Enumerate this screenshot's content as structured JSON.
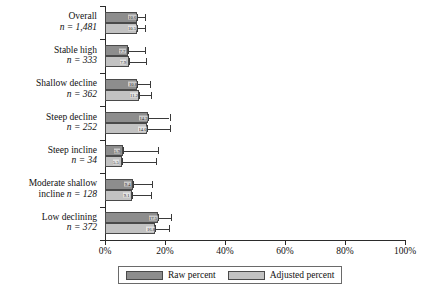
{
  "chart_data": {
    "type": "bar",
    "orientation": "horizontal",
    "title": "",
    "xlabel": "",
    "ylabel": "",
    "xlim": [
      0,
      100
    ],
    "xtick_labels": [
      "0%",
      "20%",
      "40%",
      "60%",
      "80%",
      "100%"
    ],
    "xtick_values": [
      0,
      20,
      40,
      60,
      80,
      100
    ],
    "grid": false,
    "legend_position": "bottom",
    "categories": [
      "Overall",
      "Stable high",
      "Shallow decline",
      "Steep decline",
      "Steep incline",
      "Moderate shallow incline",
      "Low declining"
    ],
    "category_n_labels": [
      "n = 1,481",
      "n = 333",
      "n = 362",
      "n = 252",
      "n = 34",
      "n = 128",
      "n = 372"
    ],
    "series": [
      {
        "name": "Raw percent",
        "color": "#8d8d8d",
        "values": [
          10.6,
          7.7,
          10.8,
          14.3,
          5.9,
          9.4,
          17.5
        ],
        "ci_low": [
          10.6,
          7.7,
          10.8,
          14.3,
          5.9,
          9.4,
          17.5
        ],
        "ci_high": [
          13.2,
          13.4,
          15.0,
          21.5,
          17.6,
          15.6,
          22.0
        ]
      },
      {
        "name": "Adjusted percent",
        "color": "#c2c2c2",
        "values": [
          10.5,
          7.9,
          11.2,
          14.0,
          5.5,
          9.1,
          16.8
        ],
        "ci_low": [
          10.5,
          7.9,
          11.2,
          14.0,
          5.5,
          9.1,
          16.8
        ],
        "ci_high": [
          13.4,
          13.8,
          15.4,
          21.8,
          17.0,
          15.2,
          21.4
        ]
      }
    ]
  },
  "legend": {
    "items": [
      {
        "label": "Raw percent",
        "swatch": "raw"
      },
      {
        "label": "Adjusted percent",
        "swatch": "adj"
      }
    ]
  },
  "categories": [
    {
      "name": "Overall",
      "n": "n = 1,481",
      "inline": false
    },
    {
      "name": "Stable high",
      "n": "n = 333",
      "inline": false
    },
    {
      "name": "Shallow decline",
      "n": "n = 362",
      "inline": false
    },
    {
      "name": "Steep decline",
      "n": "n = 252",
      "inline": false
    },
    {
      "name": "Steep incline",
      "n": "n = 34",
      "inline": false
    },
    {
      "name": "Moderate shallow",
      "n": "incline n = 128",
      "inline": true
    },
    {
      "name": "Low declining",
      "n": "n = 372",
      "inline": false
    }
  ],
  "xticks": [
    {
      "label": "0%",
      "value": 0
    },
    {
      "label": "20%",
      "value": 20
    },
    {
      "label": "40%",
      "value": 40
    },
    {
      "label": "60%",
      "value": 60
    },
    {
      "label": "80%",
      "value": 80
    },
    {
      "label": "100%",
      "value": 100
    }
  ]
}
